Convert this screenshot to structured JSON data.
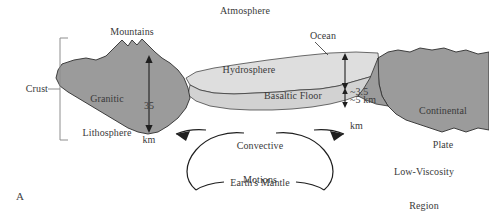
{
  "figure": {
    "panel_letter": "A",
    "colors": {
      "rock_dark": "#9b9b9b",
      "hydrosphere": "#dedede",
      "basaltic_floor": "#d2d2d2",
      "outline": "#2e2e2e",
      "text": "#3a3a3a",
      "background": "#ffffff"
    }
  },
  "labels": {
    "atmosphere": "Atmosphere",
    "mountains": "Mountains",
    "ocean": "Ocean",
    "crust": "Crust",
    "granitic_lithosphere_line1": "Granitic",
    "granitic_lithosphere_line2": "Lithosphere",
    "hydrosphere": "Hydrosphere",
    "basaltic_floor": "Basaltic Floor",
    "continental_plate_line1": "Continental",
    "continental_plate_line2": "Plate",
    "low_viscosity_line1": "Low-Viscosity",
    "low_viscosity_line2": "Region",
    "convective_line1": "Convective",
    "convective_line2": "Motions",
    "earths_mantle": "Earth's Mantle"
  },
  "measurements": {
    "crust_thickness_value": "35",
    "crust_thickness_unit": "km",
    "ocean_depth_value": "~3.5",
    "ocean_depth_unit": "km",
    "basalt_thickness": "~5 km"
  }
}
